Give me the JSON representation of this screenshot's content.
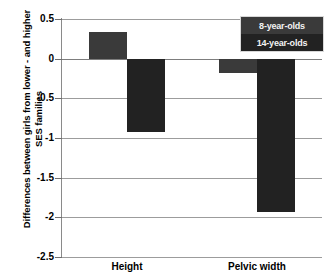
{
  "chart_data": {
    "type": "bar",
    "title": "",
    "xlabel": "",
    "ylabel": "Differences between girls from lower - and higher SES families",
    "ylabel_line1": "Differences between girls from lower - and higher",
    "ylabel_line2": "SES families",
    "categories": [
      "Height",
      "Pelvic width"
    ],
    "series": [
      {
        "name": "8-year-olds",
        "values": [
          0.33,
          -0.18
        ],
        "color": "#3a3a3a"
      },
      {
        "name": "14-year-olds",
        "values": [
          -0.93,
          -1.93
        ],
        "color": "#222222"
      }
    ],
    "ylim": [
      -2.5,
      0.5
    ],
    "ytick_values": [
      0.5,
      0,
      -0.5,
      -1,
      -1.5,
      -2,
      -2.5
    ],
    "ytick_labels": [
      "0.5",
      "0",
      "-0.5",
      "-1",
      "-1.5",
      "-2",
      "-2.5"
    ],
    "grid": true,
    "legend_position": "top-right",
    "legend_entries": [
      "8-year-olds",
      "14-year-olds"
    ],
    "background_color": "#ffffff",
    "grid_color": "#9c9c9c",
    "axis_color": "#8a8a8a"
  }
}
